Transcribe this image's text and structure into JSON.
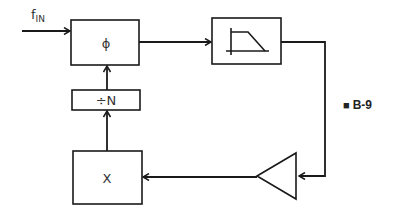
{
  "diagram": {
    "type": "block-diagram",
    "input": {
      "label_main": "f",
      "label_sub": "IN"
    },
    "blocks": [
      {
        "id": "phase-detector",
        "label": "ϕ"
      },
      {
        "id": "low-pass-filter",
        "label": "",
        "icon": "low-pass-filter-response-icon"
      },
      {
        "id": "amplifier",
        "label": "",
        "icon": "amplifier-triangle-icon"
      },
      {
        "id": "multiplier",
        "label": "X"
      },
      {
        "id": "divider",
        "label": "÷N"
      }
    ],
    "connections": [
      {
        "from": "input",
        "to": "phase-detector"
      },
      {
        "from": "phase-detector",
        "to": "low-pass-filter"
      },
      {
        "from": "low-pass-filter",
        "to": "amplifier"
      },
      {
        "from": "amplifier",
        "to": "multiplier"
      },
      {
        "from": "multiplier",
        "to": "divider"
      },
      {
        "from": "divider",
        "to": "phase-detector"
      }
    ],
    "figure_label": {
      "marker": "■",
      "text": "B-9"
    }
  }
}
